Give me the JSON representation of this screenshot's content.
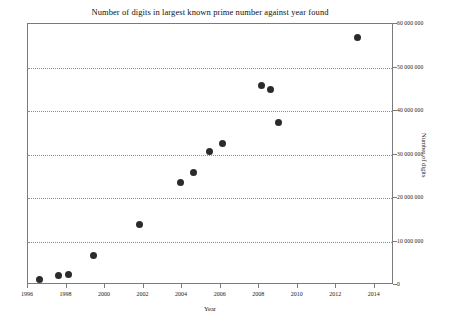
{
  "chart_data": {
    "type": "scatter",
    "title": "Number of digits in largest known prime number against year found",
    "xlabel": "Year",
    "ylabel": "Number of digits",
    "xlim": [
      1996,
      2015
    ],
    "ylim": [
      0,
      60000000
    ],
    "grid": true,
    "grid_axis": "y",
    "legend": null,
    "legend_position": "none",
    "marker": {
      "shape": "circle",
      "color": "#2b2b2b",
      "size_px": 7
    },
    "xticks": [
      1996,
      1998,
      2000,
      2002,
      2004,
      2006,
      2008,
      2010,
      2012,
      2014
    ],
    "xtick_labels": [
      "1996",
      "1998",
      "2000",
      "2002",
      "2004",
      "2006",
      "2008",
      "2010",
      "2012",
      "2014"
    ],
    "yticks": [
      0,
      10000000,
      20000000,
      30000000,
      40000000,
      50000000,
      60000000
    ],
    "ytick_labels": [
      "0",
      "10 000 000",
      "20 000 000",
      "30 000 000",
      "40 000 000",
      "50 000 000",
      "60 000 000"
    ],
    "yaxis_side": "right",
    "x": [
      1996.6,
      1997.6,
      1998.1,
      1999.4,
      2001.8,
      2003.9,
      2004.6,
      2005.4,
      2006.1,
      2008.1,
      2008.6,
      2009.0,
      2013.1
    ],
    "y": [
      1200000,
      2100000,
      2300000,
      6700000,
      14000000,
      23500000,
      25800000,
      30600000,
      32500000,
      45800000,
      45000000,
      37300000,
      57000000
    ],
    "points": [
      {
        "year": 1996.6,
        "digits": 1200000
      },
      {
        "year": 1997.6,
        "digits": 2100000
      },
      {
        "year": 1998.1,
        "digits": 2300000
      },
      {
        "year": 1999.4,
        "digits": 6700000
      },
      {
        "year": 2001.8,
        "digits": 14000000
      },
      {
        "year": 2003.9,
        "digits": 23500000
      },
      {
        "year": 2004.6,
        "digits": 25800000
      },
      {
        "year": 2005.4,
        "digits": 30600000
      },
      {
        "year": 2006.1,
        "digits": 32500000
      },
      {
        "year": 2008.1,
        "digits": 45800000
      },
      {
        "year": 2008.6,
        "digits": 45000000
      },
      {
        "year": 2009.0,
        "digits": 37300000
      },
      {
        "year": 2013.1,
        "digits": 57000000
      }
    ]
  }
}
